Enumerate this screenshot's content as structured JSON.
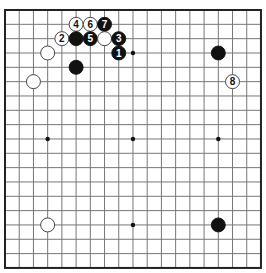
{
  "board": {
    "size": 19,
    "origin_x": 5,
    "origin_y": 10,
    "spacing_x": 14.22,
    "spacing_y": 14.33,
    "line_color": "#777777",
    "border_color": "#222222",
    "background": "#ffffff"
  },
  "star_points": [
    [
      3,
      3
    ],
    [
      9,
      3
    ],
    [
      15,
      3
    ],
    [
      3,
      9
    ],
    [
      9,
      9
    ],
    [
      15,
      9
    ],
    [
      3,
      15
    ],
    [
      9,
      15
    ],
    [
      15,
      15
    ]
  ],
  "stones": [
    {
      "color": "white",
      "col": 5,
      "row": 1,
      "label": "4"
    },
    {
      "color": "white",
      "col": 6,
      "row": 1,
      "label": "6"
    },
    {
      "color": "black",
      "col": 7,
      "row": 1,
      "label": "7"
    },
    {
      "color": "white",
      "col": 4,
      "row": 2,
      "label": "2"
    },
    {
      "color": "black",
      "col": 5,
      "row": 2,
      "label": ""
    },
    {
      "color": "black",
      "col": 6,
      "row": 2,
      "label": "5"
    },
    {
      "color": "white",
      "col": 7,
      "row": 2,
      "label": ""
    },
    {
      "color": "black",
      "col": 8,
      "row": 2,
      "label": "3"
    },
    {
      "color": "white",
      "col": 3,
      "row": 3,
      "label": ""
    },
    {
      "color": "black",
      "col": 8,
      "row": 3,
      "label": "1"
    },
    {
      "color": "black",
      "col": 5,
      "row": 4,
      "label": ""
    },
    {
      "color": "white",
      "col": 2,
      "row": 5,
      "label": ""
    },
    {
      "color": "black",
      "col": 15,
      "row": 3,
      "label": ""
    },
    {
      "color": "white",
      "col": 16,
      "row": 5,
      "label": "8"
    },
    {
      "color": "white",
      "col": 3,
      "row": 15,
      "label": ""
    },
    {
      "color": "black",
      "col": 15,
      "row": 15,
      "label": ""
    }
  ]
}
